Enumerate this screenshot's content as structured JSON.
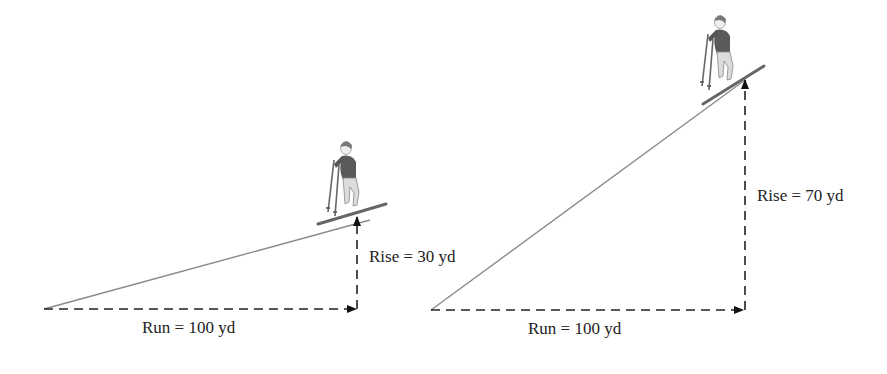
{
  "diagrams": [
    {
      "name": "gentle-slope",
      "run_label": "Run = 100 yd",
      "rise_label": "Rise = 30 yd",
      "run": 100,
      "rise": 30,
      "unit": "yd"
    },
    {
      "name": "steep-slope",
      "run_label": "Run = 100 yd",
      "rise_label": "Rise = 70 yd",
      "run": 100,
      "rise": 70,
      "unit": "yd"
    }
  ],
  "colors": {
    "slope_line": "#8a8a8a",
    "dash": "#222222",
    "text": "#222222",
    "skier_jacket": "#5a5a5a",
    "skier_pants": "#d8d8d8"
  }
}
